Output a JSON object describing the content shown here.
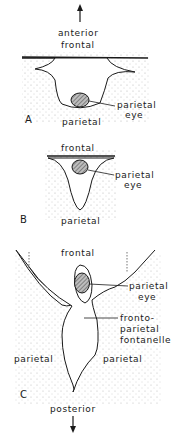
{
  "diagram": {
    "direction_top": "anterior",
    "direction_bottom": "posterior",
    "panels": [
      {
        "id": "A",
        "labels": {
          "top": "frontal",
          "bottom": "parietal",
          "eye_line1": "parietal",
          "eye_line2": "eye"
        }
      },
      {
        "id": "B",
        "labels": {
          "top": "frontal",
          "bottom": "parietal",
          "eye_line1": "parietal",
          "eye_line2": "eye"
        }
      },
      {
        "id": "C",
        "labels": {
          "top": "frontal",
          "left": "parietal",
          "right": "parietal",
          "eye_line1": "parietal",
          "eye_line2": "eye",
          "fontanelle_line1": "fronto-",
          "fontanelle_line2": "parietal",
          "fontanelle_line3": "fontanelle"
        }
      }
    ]
  },
  "colors": {
    "line": "#1a1a1a",
    "stipple": "#9a9a9a",
    "eye_fill": "#7a7a7a"
  }
}
